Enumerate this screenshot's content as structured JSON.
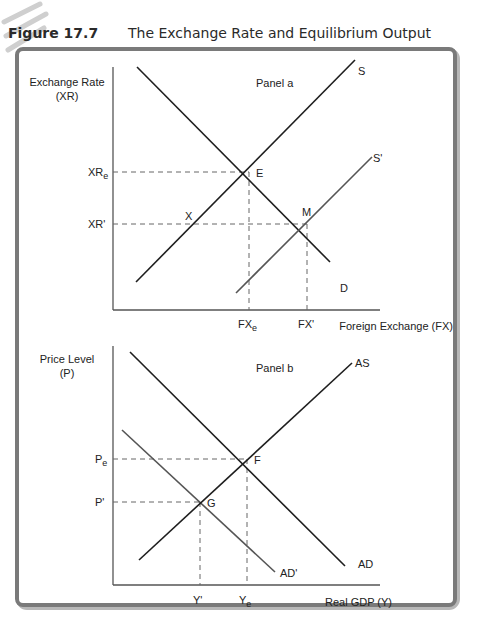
{
  "figure": {
    "number": "Figure 17.7",
    "title": "The Exchange Rate and Equilibrium Output"
  },
  "colors": {
    "frame": "#777777",
    "frame_shadow": "#9a9a9a",
    "axis": "#555555",
    "curve_dark": "#1e1e1e",
    "curve_gray": "#555555",
    "dashed": "#666666"
  },
  "panel_a": {
    "label": "Panel a",
    "y_axis_label_line1": "Exchange Rate",
    "y_axis_label_line2": "(XR)",
    "x_axis_label": "Foreign Exchange (FX)",
    "y_ticks": {
      "xre": "XR",
      "xre_sub": "e",
      "xr_prime": "XR'"
    },
    "x_ticks": {
      "fxe": "FX",
      "fxe_sub": "e",
      "fx_prime": "FX'"
    },
    "curves": {
      "S": "S",
      "S_prime": "S'",
      "D": "D"
    },
    "points": {
      "E": "E",
      "M": "M",
      "X": "X"
    }
  },
  "panel_b": {
    "label": "Panel b",
    "y_axis_label_line1": "Price Level",
    "y_axis_label_line2": "(P)",
    "x_axis_label": "Real GDP (Y)",
    "y_ticks": {
      "pe": "P",
      "pe_sub": "e",
      "p_prime": "P'"
    },
    "x_ticks": {
      "ye": "Y",
      "ye_sub": "e",
      "y_prime": "Y'"
    },
    "curves": {
      "AS": "AS",
      "AD": "AD",
      "AD_prime": "AD'"
    },
    "points": {
      "F": "F",
      "G": "G"
    }
  }
}
